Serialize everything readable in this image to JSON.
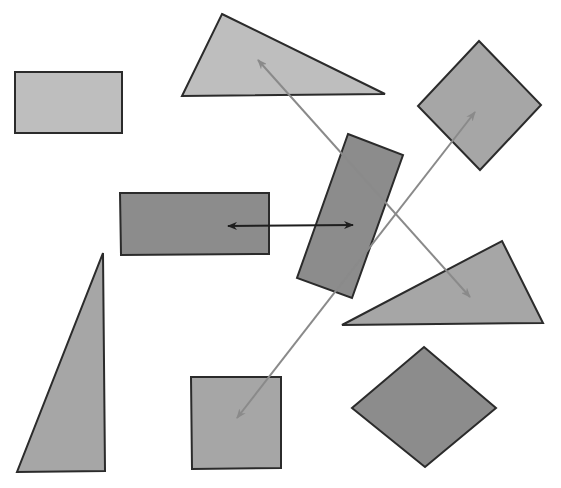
{
  "canvas": {
    "width": 561,
    "height": 488,
    "background": "#ffffff"
  },
  "colors": {
    "light": "#bebebe",
    "medium": "#a6a6a6",
    "dark": "#8c8c8c",
    "stroke": "#2b2b2b",
    "arrow_black": "#1e1e1e",
    "arrow_gray": "#8a8a8a"
  },
  "shapes": [
    {
      "id": "rect-top-left",
      "type": "rectangle",
      "shade": "light",
      "points": "15,72 122,72 122,133 15,133"
    },
    {
      "id": "triangle-top",
      "type": "triangle",
      "shade": "light",
      "points": "222,14 385,94 182,96"
    },
    {
      "id": "diamond-top-right",
      "type": "square-rotated",
      "shade": "medium",
      "points": "479,41 541,105 480,170 418,106"
    },
    {
      "id": "rect-middle-left",
      "type": "rectangle",
      "shade": "dark",
      "points": "120,193 269,193 269,254 121,255"
    },
    {
      "id": "rect-tilted-center",
      "type": "rectangle-rotated",
      "shade": "dark",
      "points": "348,134 403,155 352,298 297,278"
    },
    {
      "id": "triangle-right",
      "type": "triangle",
      "shade": "medium",
      "points": "502,241 543,323 342,325"
    },
    {
      "id": "triangle-tall-left",
      "type": "triangle",
      "shade": "medium",
      "points": "103,253 105,471 17,472"
    },
    {
      "id": "square-bottom",
      "type": "square",
      "shade": "medium",
      "points": "191,377 281,377 281,468 192,469"
    },
    {
      "id": "diamond-bottom",
      "type": "rhombus",
      "shade": "dark",
      "points": "424,347 496,408 425,467 352,408"
    }
  ],
  "arrows": [
    {
      "id": "arrow-horizontal",
      "color": "arrow_black",
      "x1": 228,
      "y1": 226,
      "x2": 353,
      "y2": 225,
      "heads": "both"
    },
    {
      "id": "arrow-diagonal-down",
      "color": "arrow_gray",
      "x1": 258,
      "y1": 60,
      "x2": 470,
      "y2": 297,
      "heads": "both"
    },
    {
      "id": "arrow-diagonal-up",
      "color": "arrow_gray",
      "x1": 237,
      "y1": 418,
      "x2": 475,
      "y2": 112,
      "heads": "both"
    }
  ]
}
